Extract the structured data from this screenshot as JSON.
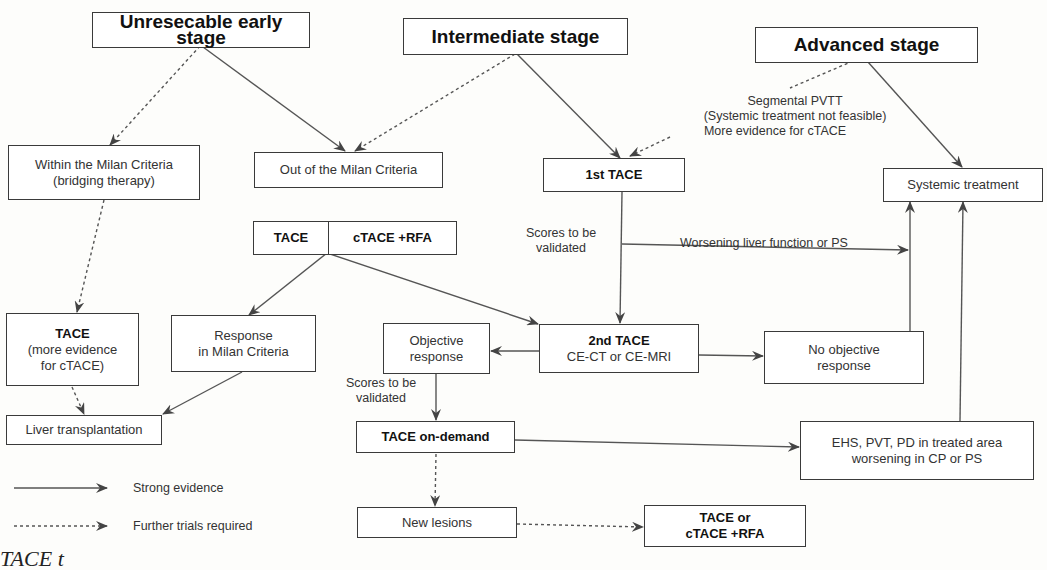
{
  "stages": {
    "early": "Unresecable early stage",
    "intermediate": "Intermediate stage",
    "advanced": "Advanced stage"
  },
  "nodes": {
    "within_milan": [
      "Within the Milan Criteria",
      "(bridging therapy)"
    ],
    "out_milan": "Out of the Milan Criteria",
    "first_tace": "1st TACE",
    "systemic": "Systemic treatment",
    "tace_split": {
      "left": "TACE",
      "right": "cTACE +RFA"
    },
    "tace_evidence": {
      "title": "TACE",
      "line1": "(more evidence",
      "line2": "for cTACE)"
    },
    "response_milan": [
      "Response",
      "in Milan Criteria"
    ],
    "objective_response": [
      "Objective",
      "response"
    ],
    "second_tace": {
      "title": "2nd TACE",
      "sub": "CE-CT or CE-MRI"
    },
    "no_objective": [
      "No objective",
      "response"
    ],
    "liver_tx": "Liver transplantation",
    "tace_on_demand": "TACE on-demand",
    "ehs": [
      "EHS, PVT, PD in treated area",
      "worsening in CP or PS"
    ],
    "new_lesions": "New lesions",
    "tace_or_ctace": [
      "TACE or",
      "cTACE +RFA"
    ]
  },
  "labels": {
    "pvtt": [
      "Segmental PVTT",
      "(Systemic treatment not feasible)",
      "More evidence for cTACE"
    ],
    "scores1": [
      "Scores to be",
      "validated"
    ],
    "scores2": [
      "Scores to be",
      "validated"
    ],
    "worsening": "Worsening liver function or PS"
  },
  "legend": {
    "strong": "Strong evidence",
    "further": "Further trials required"
  },
  "caption": "TACE t"
}
